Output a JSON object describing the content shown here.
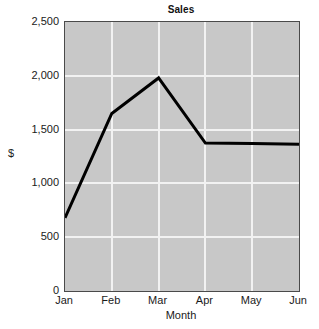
{
  "chart_data": {
    "type": "line",
    "title": "Sales",
    "xlabel": "Month",
    "ylabel": "$",
    "categories": [
      "Jan",
      "Feb",
      "Mar",
      "Apr",
      "May",
      "Jun"
    ],
    "values": [
      680,
      1650,
      1980,
      1375,
      1370,
      1365
    ],
    "series": [
      {
        "name": "Sales",
        "values": [
          680,
          1650,
          1980,
          1375,
          1370,
          1365
        ]
      }
    ],
    "ylim": [
      0,
      2500
    ],
    "ytick_values": [
      0,
      500,
      1000,
      1500,
      2000,
      2500
    ],
    "ytick_labels": [
      "0",
      "500",
      "1,000",
      "1,500",
      "2,000",
      "2,500"
    ],
    "xtick_labels": [
      "Jan",
      "Feb",
      "Mar",
      "Apr",
      "May",
      "Jun"
    ],
    "grid": true,
    "grid_color": "#f2f2f2",
    "legend": false,
    "legend_position": "none",
    "plot_background": "#c8c8c8",
    "line_color": "#000000",
    "line_width": 3,
    "figure_background": "#ffffff"
  }
}
